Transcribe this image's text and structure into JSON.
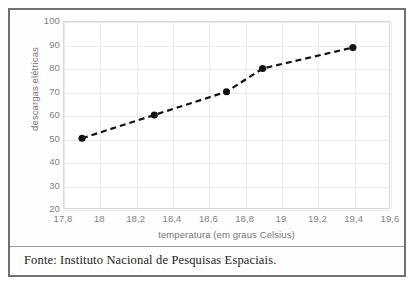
{
  "figure": {
    "source_note": "Fonte: Instituto Nacional de Pesquisas Espaciais."
  },
  "chart_data": {
    "type": "line",
    "title": "",
    "subtitle": "",
    "xlabel": "temperatura (em graus Celsius)",
    "ylabel": "descargas elétricas",
    "xlim": [
      17.8,
      19.6
    ],
    "ylim": [
      20,
      100
    ],
    "xticks": [
      "17,8",
      "18",
      "18,2",
      "18,4",
      "18,6",
      "18,8",
      "19",
      "19,2",
      "19,4",
      "19,6"
    ],
    "xtick_values": [
      17.8,
      18.0,
      18.2,
      18.4,
      18.6,
      18.8,
      19.0,
      19.2,
      19.4,
      19.6
    ],
    "yticks": [
      "100",
      "90",
      "80",
      "70",
      "60",
      "50",
      "40",
      "30",
      "20"
    ],
    "ytick_values": [
      100,
      90,
      80,
      70,
      60,
      50,
      40,
      30,
      20
    ],
    "grid": true,
    "legend": "none",
    "x": [
      17.9,
      18.3,
      18.7,
      18.9,
      19.4
    ],
    "y": [
      50,
      60,
      70,
      80,
      89
    ],
    "points": [
      {
        "x": 17.9,
        "y": 50
      },
      {
        "x": 18.3,
        "y": 60
      },
      {
        "x": 18.7,
        "y": 70
      },
      {
        "x": 18.9,
        "y": 80
      },
      {
        "x": 19.4,
        "y": 89
      }
    ],
    "line_style": "dashed",
    "marker": "circle",
    "series_color": "#121212",
    "grid_color": "#e9eaec",
    "axis_color": "#d9dadb",
    "tick_label_color": "#808285",
    "frame_color": "#6f7275"
  }
}
